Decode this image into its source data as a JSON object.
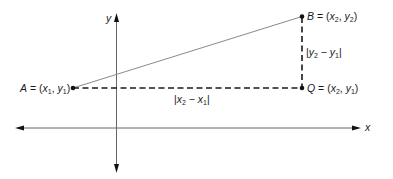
{
  "diagram": {
    "axes": {
      "x_label": "x",
      "y_label": "y"
    },
    "points": {
      "A": {
        "name": "A",
        "coords": "(x1, y1)",
        "label": "A = (x1, y1)"
      },
      "B": {
        "name": "B",
        "coords": "(x2, y2)",
        "label": "B = (x2, y2)"
      },
      "Q": {
        "name": "Q",
        "coords": "(x2, y1)",
        "label": "Q = (x2, y1)"
      }
    },
    "segments": {
      "horizontal": {
        "from": "A",
        "to": "Q",
        "style": "dashed",
        "label": "|x2 − x1|"
      },
      "vertical": {
        "from": "Q",
        "to": "B",
        "style": "dashed",
        "label": "|y2 − y1|"
      },
      "hypotenuse": {
        "from": "A",
        "to": "B",
        "style": "solid"
      }
    },
    "colors": {
      "axis": "#555555",
      "hypotenuse": "#8a8a8a",
      "dashed": "#1a1a1a",
      "point": "#111111",
      "text": "#1a1a1a"
    }
  }
}
